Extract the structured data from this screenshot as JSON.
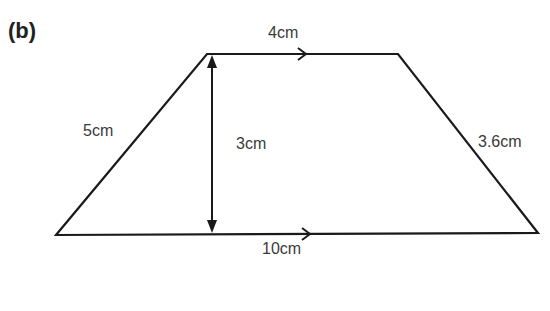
{
  "part_label": "(b)",
  "shape": "trapezium",
  "labels": {
    "top": "4cm",
    "bottom": "10cm",
    "left": "5cm",
    "right": "3.6cm",
    "height": "3cm"
  },
  "colors": {
    "line": "#1a1a1a",
    "text": "#3a3a3a"
  }
}
